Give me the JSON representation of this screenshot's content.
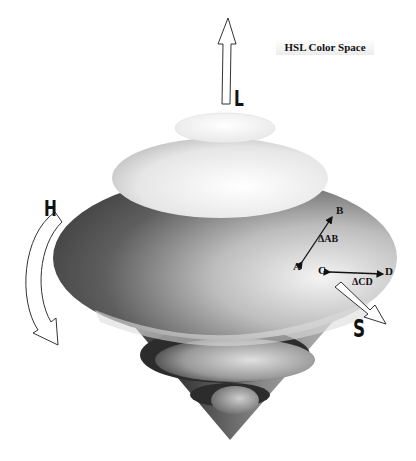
{
  "figure": {
    "title": "HSL Color Space",
    "axes": {
      "lightness": "L",
      "hue": "H",
      "saturation": "S"
    },
    "points": [
      "A",
      "B",
      "C",
      "D"
    ],
    "distances": {
      "ab": "ΔAB",
      "cd": "ΔCD"
    },
    "colors": {
      "background": "#ffffff",
      "ink": "#111111",
      "dark_surface": "#3a3a3a",
      "light_surface": "#f2f2f2"
    }
  }
}
